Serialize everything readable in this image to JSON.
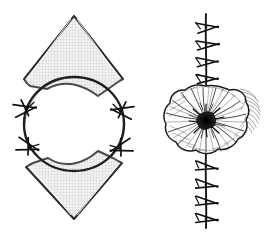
{
  "figure": {
    "title": "Purse-string and rhomboid flap closure of a circular skin defect",
    "background_color": "#ffffff",
    "ink_color": "#1a1a1a",
    "flap_fill_color": "#ececec",
    "flap_hatch_color": "#b9b9b9",
    "rosette_core_color": "#111111",
    "panels": [
      {
        "id": "panel-left",
        "label": "",
        "description": "Pre-operative plan: circular defect with superior and inferior rhomboid flaps and four interrupted sutures",
        "elements": {
          "defect": {
            "name": "circular-defect",
            "shape": "ellipse",
            "center_x": 74,
            "center_y": 124,
            "radius_x": 50,
            "radius_y": 47,
            "stroke_width": 2.2
          },
          "upper_flap": {
            "name": "superior-rhomboid-flap",
            "apex_x": 74,
            "apex_y": 16,
            "left_x": 24,
            "left_y": 79,
            "right_x": 123,
            "right_y": 79,
            "fill": "#ececec"
          },
          "lower_flap": {
            "name": "inferior-rhomboid-flap",
            "apex_x": 74,
            "apex_y": 219,
            "left_x": 26,
            "left_y": 166,
            "right_x": 122,
            "right_y": 163,
            "fill": "#ececec"
          },
          "sutures": [
            {
              "name": "suture-upper-left",
              "x": 26,
              "y": 108,
              "angle": 200
            },
            {
              "name": "suture-lower-left",
              "x": 29,
              "y": 147,
              "angle": 200
            },
            {
              "name": "suture-upper-right",
              "x": 121,
              "y": 110,
              "angle": 20
            },
            {
              "name": "suture-lower-right",
              "x": 120,
              "y": 148,
              "angle": 20
            }
          ],
          "suture_count": 4
        }
      },
      {
        "id": "panel-right",
        "label": "",
        "description": "Post-operative result: pleated purse-string rosette at the center with interrupted suture lines above and below",
        "elements": {
          "rosette": {
            "name": "purse-string-rosette",
            "center_x": 206,
            "center_y": 120,
            "radius_x": 42,
            "radius_y": 34,
            "lobe_count": 11,
            "pleat_count": 34,
            "core_radius": 7
          },
          "suture_line_upper": {
            "name": "suture-line-superior",
            "x": 206,
            "y_start": 14,
            "y_end": 88,
            "suture_count": 5
          },
          "suture_line_lower": {
            "name": "suture-line-inferior",
            "x": 206,
            "y_start": 155,
            "y_end": 228,
            "suture_count": 4
          },
          "lateral_shading": {
            "name": "lateral-skin-shading",
            "x": 246,
            "y": 100,
            "line_count": 14
          }
        }
      }
    ]
  }
}
